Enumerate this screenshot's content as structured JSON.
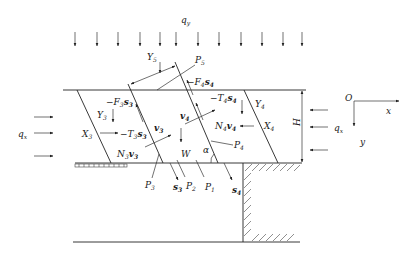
{
  "diagram": {
    "type": "free-body diagram of slope / retaining structure with slices",
    "loads": {
      "vertical_load_label": "q",
      "vertical_load_sub": "y",
      "horizontal_load_left_label": "q",
      "horizontal_load_left_sub": "x",
      "horizontal_load_right_label": "q",
      "horizontal_load_right_sub": "x"
    },
    "dimensions": {
      "height_label": "H",
      "angle_label": "α"
    },
    "axes": {
      "origin_label": "O",
      "x_label": "x",
      "y_label": "y"
    },
    "slice3": {
      "Y": "Y",
      "Y_sub": "3",
      "X": "X",
      "X_sub": "3",
      "F": "−F",
      "F_sub": "3",
      "F_s": "s",
      "F_s_sub": "3",
      "T": "−T",
      "T_sub": "3",
      "T_s": "s",
      "T_s_sub": "3",
      "N": "N",
      "N_sub": "3",
      "N_v": "v",
      "N_v_sub": "3",
      "v": "v",
      "v_sub": "3",
      "s": "s",
      "s_sub": "3"
    },
    "slice4": {
      "Y": "Y",
      "Y_sub": "4",
      "X": "X",
      "X_sub": "4",
      "F": "−F",
      "F_sub": "4",
      "F_s": "s",
      "F_s_sub": "4",
      "T": "−T",
      "T_sub": "4",
      "T_s": "s",
      "T_s_sub": "4",
      "N": "N",
      "N_sub": "4",
      "N_v": "v",
      "N_v_sub": "4",
      "v": "v",
      "v_sub": "4",
      "s": "s",
      "s_sub": "4"
    },
    "top_block": {
      "Y": "Y",
      "Y_sub": "5",
      "P": "P",
      "P_sub": "5"
    },
    "points": {
      "P1": "P",
      "P1_sub": "1",
      "P2": "P",
      "P2_sub": "2",
      "P3": "P",
      "P3_sub": "3",
      "P4": "P",
      "P4_sub": "4"
    },
    "weight_label": "W"
  }
}
